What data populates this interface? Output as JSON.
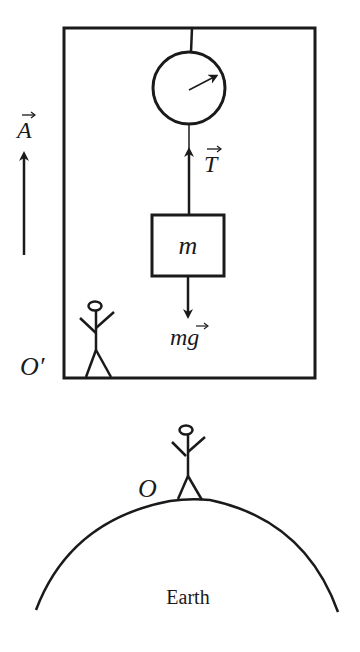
{
  "diagram": {
    "type": "physics-free-body",
    "colors": {
      "stroke": "#1a1a1a",
      "background": "#ffffff"
    },
    "labels": {
      "acceleration": "A",
      "tension": "T",
      "mass": "m",
      "weight_m": "m",
      "weight_g": "g",
      "elevator_origin": "O′",
      "earth_origin": "O",
      "earth": "Earth"
    },
    "vector_marker": "→"
  }
}
